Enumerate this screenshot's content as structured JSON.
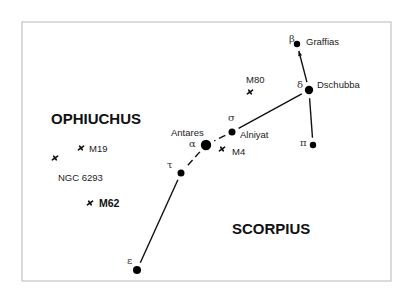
{
  "chart_data": {
    "type": "star-chart",
    "title": "",
    "frame": {
      "x": 22,
      "y": 22,
      "width": 369,
      "height": 259
    },
    "constellations": [
      {
        "name": "OPHIUCHUS",
        "x": 51,
        "y": 124
      },
      {
        "name": "SCORPIUS",
        "x": 232,
        "y": 234
      }
    ],
    "stars": [
      {
        "id": "beta",
        "greek": "β",
        "name": "Graffias",
        "x": 297,
        "y": 44,
        "r": 3.2,
        "greek_x": 289,
        "greek_y": 42,
        "name_x": 306,
        "name_y": 45
      },
      {
        "id": "delta",
        "greek": "δ",
        "name": "Dschubba",
        "x": 309,
        "y": 90,
        "r": 4.2,
        "greek_x": 297,
        "greek_y": 88,
        "name_x": 317,
        "name_y": 88
      },
      {
        "id": "pi",
        "greek": "π",
        "name": "",
        "x": 313,
        "y": 145,
        "r": 3.2,
        "greek_x": 300,
        "greek_y": 146,
        "name_x": 0,
        "name_y": 0
      },
      {
        "id": "sigma",
        "greek": "σ",
        "name": "Alniyat",
        "x": 232,
        "y": 132,
        "r": 3.5,
        "greek_x": 228,
        "greek_y": 121,
        "name_x": 240,
        "name_y": 138
      },
      {
        "id": "alpha",
        "greek": "α",
        "name": "Antares",
        "x": 206,
        "y": 145,
        "r": 5.2,
        "greek_x": 189,
        "greek_y": 147,
        "name_x": 171,
        "name_y": 136
      },
      {
        "id": "tau",
        "greek": "τ",
        "name": "",
        "x": 181,
        "y": 173,
        "r": 3.5,
        "greek_x": 167,
        "greek_y": 168,
        "name_x": 0,
        "name_y": 0
      },
      {
        "id": "epsilon",
        "greek": "ε",
        "name": "",
        "x": 137,
        "y": 270,
        "r": 4,
        "greek_x": 127,
        "greek_y": 264,
        "name_x": 0,
        "name_y": 0
      }
    ],
    "lines": [
      {
        "from": "beta",
        "to": "delta",
        "arrow": true
      },
      {
        "from": "delta",
        "to": "pi"
      },
      {
        "from": "delta",
        "to": "sigma"
      },
      {
        "from": "sigma",
        "to": "alpha",
        "dashed": true
      },
      {
        "from": "alpha",
        "to": "tau",
        "dashed": true
      },
      {
        "from": "tau",
        "to": "epsilon"
      }
    ],
    "clusters": [
      {
        "name": "M80",
        "x": 250,
        "y": 92,
        "label_x": 246,
        "label_y": 83,
        "bold": false
      },
      {
        "name": "M4",
        "x": 222,
        "y": 149,
        "label_x": 232,
        "label_y": 155,
        "bold": false
      },
      {
        "name": "M19",
        "x": 81,
        "y": 148,
        "label_x": 89,
        "label_y": 152,
        "bold": false
      },
      {
        "name": "NGC 6293",
        "x": 55,
        "y": 158,
        "label_x": 58,
        "label_y": 181,
        "bold": false
      },
      {
        "name": "M62",
        "x": 90,
        "y": 203,
        "label_x": 99,
        "label_y": 207,
        "bold": true
      }
    ]
  }
}
